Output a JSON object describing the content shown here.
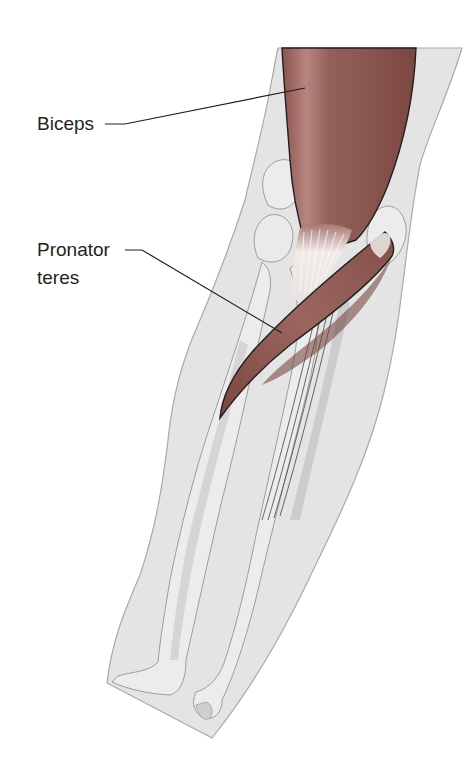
{
  "figure": {
    "colors": {
      "skin": "#e4e4e4",
      "skin_outline": "#a9a9a9",
      "bone": "#ececec",
      "bone_outline": "#9c9c9c",
      "bone_shadow": "#cfcfcf",
      "muscle": "#8e5650",
      "muscle_dark": "#6f3d39",
      "muscle_light": "#b98580",
      "tendon": "#f3efec",
      "leader_line": "#231f20"
    }
  },
  "labels": [
    {
      "id": "biceps",
      "lines": [
        "Biceps"
      ]
    },
    {
      "id": "pronator-teres",
      "lines": [
        "Pronator",
        "teres"
      ]
    }
  ]
}
